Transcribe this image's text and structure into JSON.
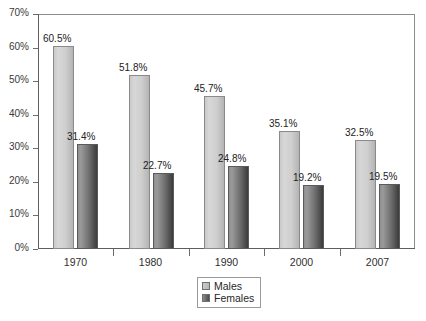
{
  "chart_data": {
    "type": "bar",
    "title": "",
    "subtitle": "",
    "xlabel": "",
    "ylabel": "",
    "categories": [
      "1970",
      "1980",
      "1990",
      "2000",
      "2007"
    ],
    "series": [
      {
        "name": "Males",
        "color": "#cfcfcf",
        "values": [
          60.5,
          51.8,
          45.7,
          35.1,
          32.5
        ],
        "labels": [
          "60.5%",
          "51.8%",
          "45.7%",
          "35.1%",
          "32.5%"
        ]
      },
      {
        "name": "Females",
        "color": "#5c5c5c",
        "values": [
          31.4,
          22.7,
          24.8,
          19.2,
          19.5
        ],
        "labels": [
          "31.4%",
          "22.7%",
          "24.8%",
          "19.2%",
          "19.5%"
        ]
      }
    ],
    "ylim": [
      0,
      70
    ],
    "ytick_values": [
      0,
      10,
      20,
      30,
      40,
      50,
      60,
      70
    ],
    "ytick_labels": [
      "0%",
      "10%",
      "20%",
      "30%",
      "40%",
      "50%",
      "60%",
      "70%"
    ],
    "grid": false,
    "legend_position": "bottom-center",
    "legend_entries": [
      "Males",
      "Females"
    ]
  },
  "legend": {
    "males_label": "Males",
    "females_label": "Females"
  }
}
